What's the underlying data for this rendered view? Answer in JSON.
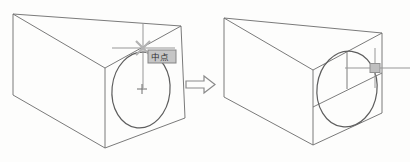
{
  "figure": {
    "background": "#fdfdfc"
  },
  "colors": {
    "edge": "#6b6b6b",
    "ellipse": "#5e5e5e",
    "crosshair": "#979797",
    "construction": "#6e6e6e",
    "snap_marker": "#b3b3b3",
    "center_marker": "#6e6e6e",
    "arrow": "#8a8a8a",
    "tooltip_bg": "#c6c6c6",
    "tooltip_border": "#858585",
    "tooltip_text": "#2f2f2f",
    "pickbox_fill": "#bfbfbf",
    "pickbox_border": "#8f8f8f"
  },
  "before": {
    "wedge": {
      "vertices": {
        "A": [
          13,
          14
        ],
        "B": [
          181,
          26
        ],
        "C": [
          105,
          68
        ],
        "D": [
          13,
          95
        ],
        "E": [
          105,
          148
        ],
        "G": [
          185,
          118
        ]
      },
      "edges": [
        [
          "A",
          "B"
        ],
        [
          "A",
          "C"
        ],
        [
          "C",
          "B"
        ],
        [
          "A",
          "D"
        ],
        [
          "D",
          "E"
        ],
        [
          "E",
          "G"
        ],
        [
          "B",
          "G"
        ],
        [
          "C",
          "E"
        ]
      ]
    },
    "ellipse": {
      "cx": 141,
      "cy": 90,
      "rx": 29,
      "ry": 38,
      "rotate": 6
    },
    "center_marker": {
      "x": 142,
      "y": 89,
      "size": 5
    },
    "cursor": {
      "cx": 143,
      "cy": 48,
      "h": [
        112,
        175
      ],
      "v": [
        23,
        88
      ]
    },
    "snap_marker": {
      "cx": 143,
      "cy": 48,
      "r": 7
    },
    "tooltip": {
      "x": 148,
      "y": 50,
      "w": 28,
      "h": 13,
      "label": "中点"
    }
  },
  "arrow": {
    "points": "186,81 204,81 204,76 215,84.5 204,93 204,88 186,88"
  },
  "after": {
    "wedge": {
      "vertices": {
        "A": [
          224,
          18
        ],
        "B": [
          382,
          33
        ],
        "C": [
          313,
          70
        ],
        "D": [
          224,
          97
        ],
        "E": [
          313,
          145
        ],
        "G": [
          382,
          113
        ]
      },
      "edges": [
        [
          "A",
          "B"
        ],
        [
          "A",
          "C"
        ],
        [
          "C",
          "B"
        ],
        [
          "A",
          "D"
        ],
        [
          "D",
          "E"
        ],
        [
          "E",
          "G"
        ],
        [
          "B",
          "G"
        ],
        [
          "C",
          "E"
        ]
      ]
    },
    "ellipse": {
      "cx": 347,
      "cy": 89,
      "rx": 30,
      "ry": 38,
      "rotate": 7
    },
    "construction_lines": [
      [
        347,
        52,
        347,
        89
      ],
      [
        313,
        107,
        382,
        73
      ]
    ],
    "cursor": {
      "cx": 375,
      "cy": 68,
      "h": [
        345,
        410
      ],
      "v": [
        48,
        88
      ]
    },
    "pickbox": {
      "x": 375,
      "y": 68,
      "w": 10,
      "h": 9
    }
  }
}
